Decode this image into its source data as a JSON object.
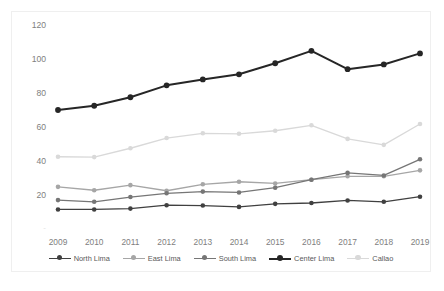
{
  "figure": {
    "background_color": "#ffffff",
    "frame_border_color": "#efefef",
    "axis_label_color": "#808080",
    "title_remnant_a": "",
    "title_remnant_b": ""
  },
  "legend": {
    "position": "bottom-center",
    "items": [
      {
        "label": "North Lima",
        "color": "#404040"
      },
      {
        "label": "East Lima",
        "color": "#a6a6a6"
      },
      {
        "label": "South Lima",
        "color": "#767676"
      },
      {
        "label": "Center Lima",
        "color": "#262626"
      },
      {
        "label": "Callao",
        "color": "#d9d9d9"
      }
    ]
  },
  "chart_data": {
    "type": "line",
    "title": "",
    "xlabel": "",
    "ylabel": "",
    "categories": [
      "2009",
      "2010",
      "2011",
      "2012",
      "2013",
      "2014",
      "2015",
      "2016",
      "2017",
      "2018",
      "2019"
    ],
    "ylim": [
      0,
      120
    ],
    "yticks": [
      0,
      20,
      40,
      60,
      80,
      100,
      120
    ],
    "ytick_labels": [
      "-",
      "20",
      "40",
      "60",
      "80",
      "100",
      "120"
    ],
    "grid": false,
    "legend_position": "bottom",
    "markers": "circle",
    "series": [
      {
        "name": "North Lima",
        "color": "#404040",
        "values": [
          11.5,
          11.5,
          12.0,
          14.0,
          13.8,
          13.0,
          14.8,
          15.3,
          16.8,
          16.0,
          19.0
        ]
      },
      {
        "name": "East Lima",
        "color": "#a6a6a6",
        "values": [
          24.8,
          22.8,
          25.8,
          22.5,
          26.3,
          27.8,
          26.8,
          29.0,
          31.0,
          31.0,
          34.5
        ]
      },
      {
        "name": "South Lima",
        "color": "#767676",
        "values": [
          17.0,
          16.0,
          18.8,
          21.0,
          22.0,
          21.5,
          24.3,
          29.0,
          33.0,
          31.5,
          41.0
        ]
      },
      {
        "name": "Center Lima",
        "color": "#262626",
        "values": [
          70.0,
          72.5,
          77.5,
          84.5,
          88.0,
          91.0,
          97.5,
          104.8,
          94.0,
          96.8,
          103.3
        ]
      },
      {
        "name": "Callao",
        "color": "#d9d9d9",
        "values": [
          42.5,
          42.3,
          47.5,
          53.5,
          56.3,
          56.0,
          57.8,
          61.0,
          53.0,
          49.5,
          61.8
        ]
      }
    ]
  }
}
